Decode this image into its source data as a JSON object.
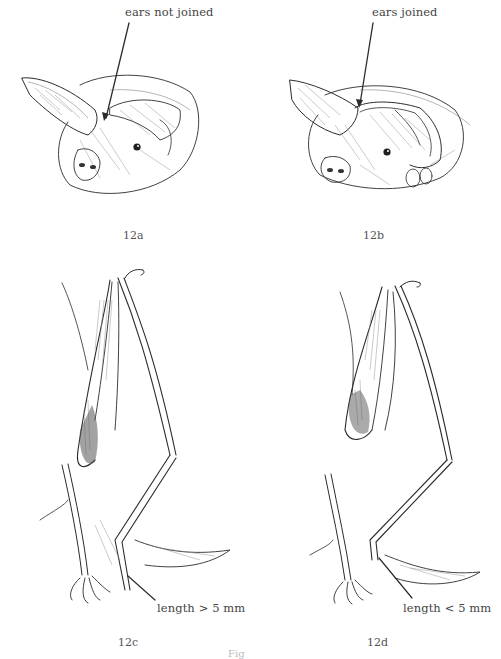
{
  "figure": {
    "panels": [
      {
        "id": "12a",
        "subject": "bat head, side view",
        "annotation": "ears not joined"
      },
      {
        "id": "12b",
        "subject": "bat head, side view",
        "annotation": "ears joined"
      },
      {
        "id": "12c",
        "subject": "bat hindlimb and folded wing",
        "annotation": "length > 5 mm"
      },
      {
        "id": "12d",
        "subject": "bat hindlimb and folded wing",
        "annotation": "length < 5 mm"
      }
    ],
    "caption_partial": "Fig"
  }
}
